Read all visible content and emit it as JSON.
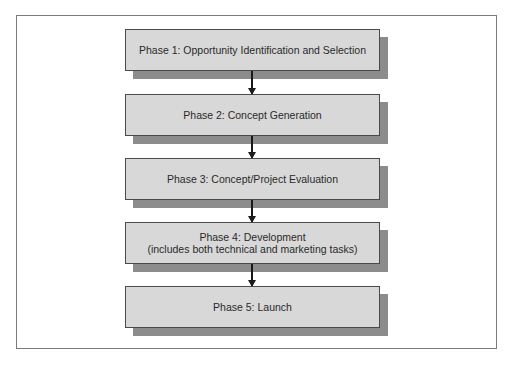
{
  "diagram": {
    "type": "flowchart",
    "direction": "top-to-bottom",
    "phases": [
      {
        "id": 1,
        "lines": [
          "Phase 1: Opportunity Identification and Selection"
        ]
      },
      {
        "id": 2,
        "lines": [
          "Phase 2: Concept Generation"
        ]
      },
      {
        "id": 3,
        "lines": [
          "Phase 3: Concept/Project Evaluation"
        ]
      },
      {
        "id": 4,
        "lines": [
          "Phase 4: Development",
          "(includes both technical and marketing tasks)"
        ]
      },
      {
        "id": 5,
        "lines": [
          "Phase 5: Launch"
        ]
      }
    ],
    "connections": [
      {
        "from": 1,
        "to": 2
      },
      {
        "from": 2,
        "to": 3
      },
      {
        "from": 3,
        "to": 4
      },
      {
        "from": 4,
        "to": 5
      }
    ],
    "colors": {
      "box_fill": "#d8d8d8",
      "box_border": "#4a4a4a",
      "shadow": "#8c8c8c",
      "arrow": "#1a1a1a",
      "frame_border": "#7a7a7a"
    }
  }
}
